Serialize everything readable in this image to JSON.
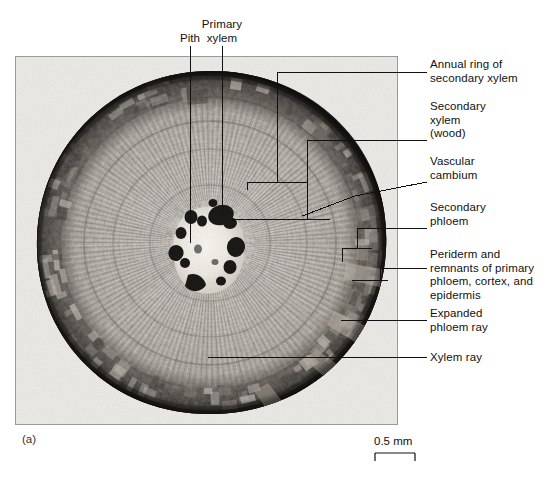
{
  "figure": {
    "panel_letter": "(a)",
    "scale_bar_label": "0.5 mm",
    "specimen": "woody dicot stem cross section"
  },
  "labels": {
    "pith": "Pith",
    "primary_xylem": "Primary\nxylem",
    "annual_ring": "Annual ring of\nsecondary xylem",
    "secondary_xylem": "Secondary\nxylem\n(wood)",
    "vascular_cambium": "Vascular\ncambium",
    "secondary_phloem": "Secondary\nphloem",
    "periderm": "Periderm and\nremnants of primary\nphloem, cortex, and\nepidermis",
    "expanded_phloem_ray": "Expanded\nphloem ray",
    "xylem_ray": "Xylem ray"
  },
  "colors": {
    "background": "#ffffff",
    "panel_background": "#ebe9e5",
    "panel_border": "#9a9a9a",
    "leader_line": "#111111",
    "text": "#111111",
    "periderm_dark": "#2c2a28",
    "wood_light": "#cfcac2",
    "wood_mid": "#a7a199",
    "pith_light": "#f2f0ea",
    "primary_xylem_dark": "#1d1b19"
  }
}
